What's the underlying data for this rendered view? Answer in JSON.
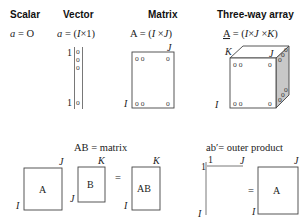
{
  "headers": {
    "scalar": "Scalar",
    "vector": "Vector",
    "matrix": "Matrix",
    "threeway": "Three-way array"
  },
  "equations": {
    "scalar": "a = O",
    "vector": "a = (I×1)",
    "matrix": "A = (I×J)",
    "threeway": "A = (I×J ×K)"
  },
  "dims": {
    "I": "I",
    "J": "J",
    "K": "K",
    "one": "1"
  },
  "element_glyph": "o",
  "element_pair": "o o",
  "product": {
    "title": "AB = matrix",
    "A": "A",
    "B": "B",
    "AB": "AB",
    "equals": "="
  },
  "outer": {
    "title": "ab′= outer product",
    "A": "A",
    "equals": "="
  }
}
